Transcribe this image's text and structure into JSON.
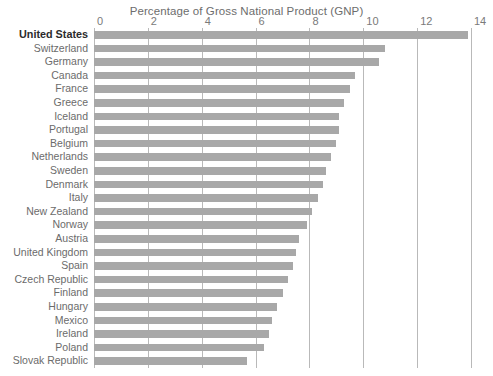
{
  "chart": {
    "title": "Percentage of Gross National Product (GNP)"
  },
  "axis": {
    "ticks": [
      "0",
      "2",
      "4",
      "6",
      "8",
      "10",
      "12",
      "14"
    ]
  },
  "colors": {
    "bar": "#a8a8a8",
    "gridline": "#b9b9b9",
    "label": "#6b6b6b",
    "highlight_label": "#2b2b2b",
    "background": "#ffffff"
  },
  "chart_data": {
    "type": "bar",
    "orientation": "horizontal",
    "title": "Percentage of Gross National Product (GNP)",
    "xlabel": "Percentage of Gross National Product (GNP)",
    "ylabel": "",
    "xlim": [
      0,
      14
    ],
    "xticks": [
      0,
      2,
      4,
      6,
      8,
      10,
      12,
      14
    ],
    "grid": "vertical",
    "legend": "none",
    "highlighted_category": "United States",
    "categories": [
      "United States",
      "Switzerland",
      "Germany",
      "Canada",
      "France",
      "Greece",
      "Iceland",
      "Portugal",
      "Belgium",
      "Netherlands",
      "Sweden",
      "Denmark",
      "Italy",
      "New Zealand",
      "Norway",
      "Austria",
      "United Kingdom",
      "Spain",
      "Czech Republic",
      "Finland",
      "Hungary",
      "Mexico",
      "Ireland",
      "Poland",
      "Slovak Republic"
    ],
    "values": [
      13.9,
      10.8,
      10.6,
      9.7,
      9.5,
      9.3,
      9.1,
      9.1,
      9.0,
      8.8,
      8.6,
      8.5,
      8.3,
      8.1,
      7.9,
      7.6,
      7.5,
      7.4,
      7.2,
      7.0,
      6.8,
      6.6,
      6.5,
      6.3,
      5.7
    ]
  }
}
